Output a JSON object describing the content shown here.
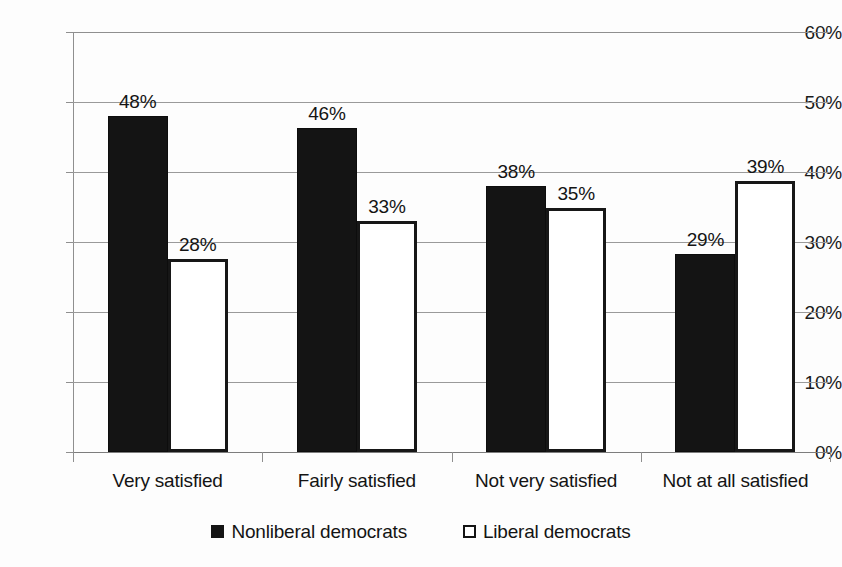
{
  "chart_data": {
    "type": "bar",
    "title": "",
    "xlabel": "",
    "ylabel": "",
    "ylim": [
      0,
      60
    ],
    "ytick_values": [
      0,
      10,
      20,
      30,
      40,
      50,
      60
    ],
    "ytick_labels": [
      "0%",
      "10%",
      "20%",
      "30%",
      "40%",
      "50%",
      "60%"
    ],
    "grid": true,
    "legend_position": "bottom",
    "categories": [
      "Very satisfied",
      "Fairly satisfied",
      "Not very satisfied",
      "Not at all satisfied"
    ],
    "series": [
      {
        "name": "Nonliberal democrats",
        "style": "filled",
        "color": "#141414",
        "values": [
          48,
          46,
          38,
          29
        ],
        "labels": [
          "48%",
          "46%",
          "38%",
          "29%"
        ],
        "plotted_values": [
          48.0,
          46.3,
          38.0,
          28.3
        ]
      },
      {
        "name": "Liberal democrats",
        "style": "outlined",
        "color": "#ffffff",
        "border_color": "#171717",
        "values": [
          28,
          33,
          35,
          39
        ],
        "labels": [
          "28%",
          "33%",
          "35%",
          "39%"
        ],
        "plotted_values": [
          27.6,
          33.0,
          34.9,
          38.7
        ]
      }
    ]
  },
  "legend": {
    "items": [
      {
        "label": "Nonliberal democrats",
        "swatch": "filled-square-icon"
      },
      {
        "label": "Liberal democrats",
        "swatch": "outlined-square-icon"
      }
    ]
  }
}
